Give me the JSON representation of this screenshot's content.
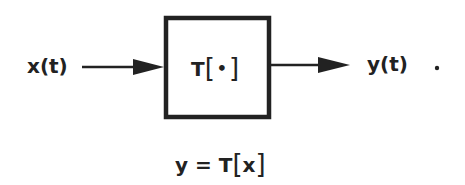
{
  "diagram": {
    "type": "block-diagram",
    "input_label": "x(t)",
    "output_label": "y(t)",
    "trailing_mark": ".",
    "system_block": {
      "operator": "T",
      "bracket_open": "[",
      "argument": "•",
      "bracket_close": "]"
    },
    "equation": {
      "lhs": "y",
      "equals": "=",
      "operator": "T",
      "bracket_open": "[",
      "argument": "x",
      "bracket_close": "]"
    },
    "colors": {
      "ink": "#222222",
      "background": "#ffffff"
    },
    "edges": [
      {
        "from": "input x(t)",
        "to": "system T[•]"
      },
      {
        "from": "system T[•]",
        "to": "output y(t)"
      }
    ]
  }
}
